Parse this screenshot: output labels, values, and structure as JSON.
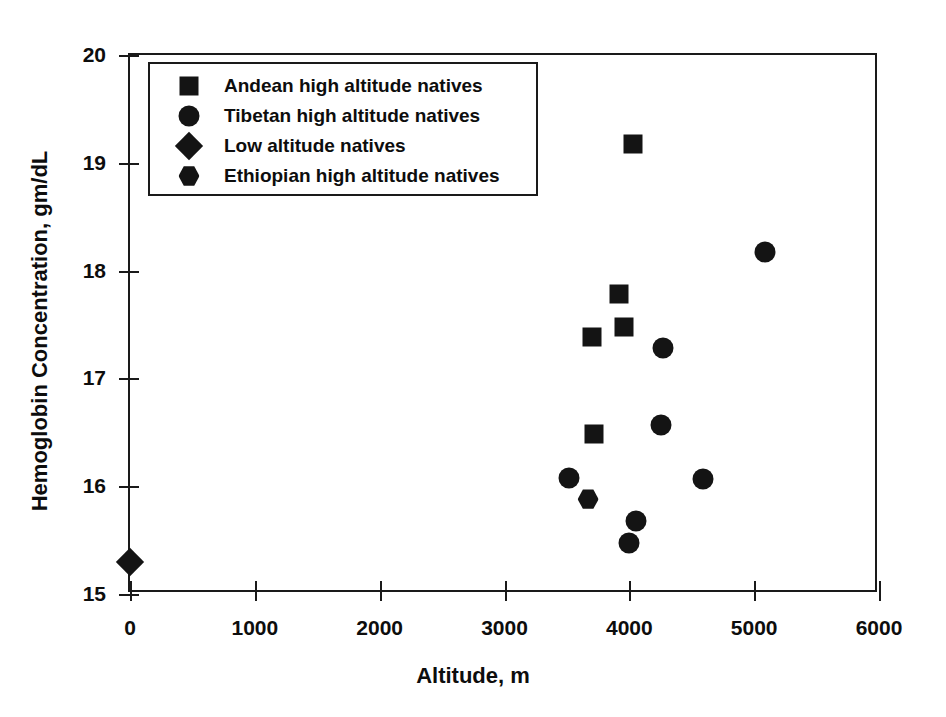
{
  "chart_data": {
    "type": "scatter",
    "title": "",
    "xlabel": "Altitude, m",
    "ylabel": "Hemoglobin Concentration, gm/dL",
    "xlim": [
      0,
      6000
    ],
    "ylim": [
      15,
      20
    ],
    "xticks": [
      0,
      1000,
      2000,
      3000,
      4000,
      5000,
      6000
    ],
    "yticks": [
      15,
      16,
      17,
      18,
      19,
      20
    ],
    "xtick_labels": [
      "0",
      "1000",
      "2000",
      "3000",
      "4000",
      "5000",
      "6000"
    ],
    "ytick_labels": [
      "15",
      "16",
      "17",
      "18",
      "19",
      "20"
    ],
    "grid": false,
    "legend_position": "upper left",
    "marker_color": "#141414",
    "series": [
      {
        "name": "Andean high altitude natives",
        "marker": "square",
        "points": [
          {
            "x": 4030,
            "y": 19.17
          },
          {
            "x": 3915,
            "y": 17.78
          },
          {
            "x": 3955,
            "y": 17.48
          },
          {
            "x": 3700,
            "y": 17.38
          },
          {
            "x": 3720,
            "y": 16.48
          }
        ]
      },
      {
        "name": "Tibetan high altitude natives",
        "marker": "circle",
        "points": [
          {
            "x": 5090,
            "y": 18.17
          },
          {
            "x": 4270,
            "y": 17.28
          },
          {
            "x": 4250,
            "y": 16.57
          },
          {
            "x": 4590,
            "y": 16.07
          },
          {
            "x": 3520,
            "y": 16.08
          },
          {
            "x": 4050,
            "y": 15.68
          },
          {
            "x": 4000,
            "y": 15.47
          }
        ]
      },
      {
        "name": "Low altitude natives",
        "marker": "diamond",
        "points": [
          {
            "x": 0,
            "y": 15.3
          }
        ]
      },
      {
        "name": "Ethiopian high altitude natives",
        "marker": "hexagon",
        "points": [
          {
            "x": 3670,
            "y": 15.88
          }
        ]
      }
    ]
  },
  "legend": {
    "items": [
      {
        "label": "Andean high altitude natives",
        "marker": "square"
      },
      {
        "label": "Tibetan high altitude natives",
        "marker": "circle"
      },
      {
        "label": "Low altitude natives",
        "marker": "diamond"
      },
      {
        "label": "Ethiopian high altitude natives",
        "marker": "hexagon"
      }
    ]
  }
}
